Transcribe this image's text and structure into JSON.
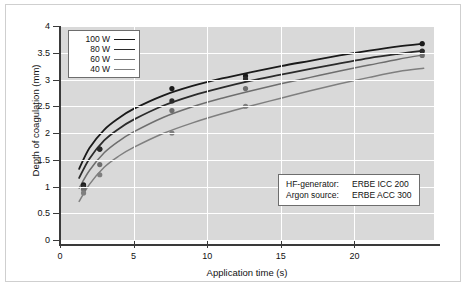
{
  "chart_data": {
    "type": "line",
    "title": "",
    "xlabel": "Application time (s)",
    "ylabel": "Depth of coagulation (mm)",
    "xlim": [
      0,
      25.4
    ],
    "ylim": [
      0,
      4
    ],
    "xticks": [
      0,
      5,
      10,
      15,
      20
    ],
    "yticks": [
      0,
      0.5,
      1,
      1.5,
      2,
      2.5,
      3,
      3.5,
      4
    ],
    "grid": true,
    "legend_position": "top-left",
    "series": [
      {
        "name": "100 W",
        "color": "#1a1a1a",
        "x": [
          1.6,
          2.7,
          7.6,
          12.6,
          24.6
        ],
        "values": [
          1.03,
          1.7,
          2.83,
          3.07,
          3.67
        ],
        "curve_x": [
          1.3,
          2,
          3,
          4,
          5,
          7,
          9,
          11,
          13,
          15,
          17,
          19,
          21,
          23,
          24.7
        ],
        "curve_y": [
          1.33,
          1.72,
          2.06,
          2.28,
          2.45,
          2.7,
          2.88,
          3.02,
          3.14,
          3.25,
          3.35,
          3.45,
          3.54,
          3.62,
          3.67
        ]
      },
      {
        "name": "80 W",
        "color": "#2b2b2b",
        "x": [
          1.6,
          2.7,
          7.6,
          12.6,
          24.6
        ],
        "values": [
          1.0,
          1.7,
          2.6,
          3.01,
          3.53
        ],
        "curve_x": [
          1.3,
          2,
          3,
          4,
          5,
          7,
          9,
          11,
          13,
          15,
          17,
          19,
          21,
          23,
          24.7
        ],
        "curve_y": [
          1.16,
          1.52,
          1.86,
          2.08,
          2.25,
          2.51,
          2.7,
          2.85,
          2.98,
          3.09,
          3.2,
          3.3,
          3.4,
          3.48,
          3.54
        ]
      },
      {
        "name": "60 W",
        "color": "#6e6e6e",
        "x": [
          1.6,
          2.7,
          7.6,
          12.6,
          24.6
        ],
        "values": [
          0.95,
          1.41,
          2.42,
          2.83,
          3.45
        ],
        "curve_x": [
          1.3,
          2,
          3,
          4,
          5,
          7,
          9,
          11,
          13,
          15,
          17,
          19,
          21,
          23,
          24.7
        ],
        "curve_y": [
          0.97,
          1.3,
          1.63,
          1.85,
          2.02,
          2.29,
          2.49,
          2.65,
          2.79,
          2.92,
          3.04,
          3.16,
          3.27,
          3.38,
          3.46
        ]
      },
      {
        "name": "40 W",
        "color": "#7f7f7f",
        "x": [
          1.6,
          2.7,
          7.6,
          12.6
        ],
        "values": [
          0.88,
          1.22,
          2.0,
          2.5
        ],
        "curve_x": [
          1.3,
          2,
          3,
          4,
          5,
          7,
          9,
          11,
          13,
          15,
          17,
          19,
          21,
          23,
          24.7
        ],
        "curve_y": [
          0.72,
          1.04,
          1.36,
          1.57,
          1.73,
          1.99,
          2.19,
          2.36,
          2.51,
          2.65,
          2.79,
          2.92,
          3.04,
          3.15,
          3.21
        ]
      }
    ]
  },
  "legend": {
    "items": [
      {
        "label": "100 W"
      },
      {
        "label": "80 W"
      },
      {
        "label": "60 W"
      },
      {
        "label": "40 W"
      }
    ]
  },
  "annotation": {
    "rows": [
      {
        "key": "HF-generator:",
        "value": "ERBE ICC  200"
      },
      {
        "key": "Argon source:",
        "value": "ERBE ACC 300"
      }
    ]
  },
  "colors": {
    "plot_background": "#d9d9d9",
    "gridline": "#ffffff",
    "axis": "#3a3a3a",
    "frame": "#cfcfcf"
  }
}
